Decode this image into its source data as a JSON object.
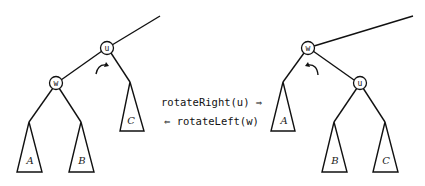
{
  "diagram": {
    "left_tree": {
      "root": "u",
      "left_child": "w",
      "subtrees": {
        "w_left": "A",
        "w_right": "B",
        "u_right": "C"
      }
    },
    "right_tree": {
      "root": "w",
      "right_child": "u",
      "subtrees": {
        "w_left": "A",
        "u_left": "B",
        "u_right": "C"
      }
    },
    "operations": {
      "forward": "rotateRight(u) ⇒",
      "backward": "⇐ rotateLeft(w)"
    }
  }
}
